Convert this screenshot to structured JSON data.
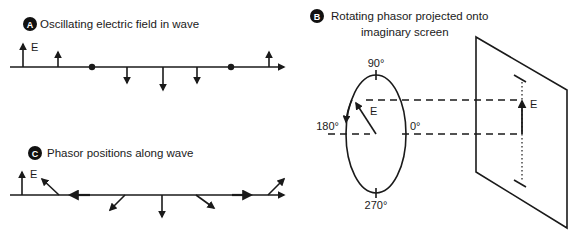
{
  "panels": {
    "a": {
      "badge": "A",
      "title": "Oscillating electric field in wave",
      "e_label": "E"
    },
    "b": {
      "badge": "B",
      "title_line1": "Rotating phasor projected onto",
      "title_line2": "imaginary screen",
      "e_label_circle": "E",
      "e_label_screen": "E",
      "angle_90": "90°",
      "angle_180": "180°",
      "angle_0": "0°",
      "angle_270": "270°"
    },
    "c": {
      "badge": "C",
      "title": "Phasor positions along wave",
      "e_label": "E"
    }
  },
  "colors": {
    "ink": "#1a1a1a",
    "badge_bg": "#111111",
    "background": "#ffffff"
  }
}
